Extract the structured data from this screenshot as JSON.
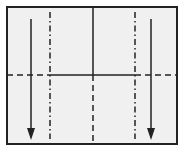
{
  "diagram": {
    "type": "origami-fold-diagram",
    "paper": {
      "fill": "#f0f0f0",
      "stroke": "#222222",
      "x": 7,
      "y": 7,
      "width": 170,
      "height": 137
    },
    "lines": [
      {
        "name": "center-crease-top",
        "kind": "solid",
        "x1": 93,
        "y1": 7,
        "x2": 93,
        "y2": 75
      },
      {
        "name": "center-valley-fold-bottom",
        "kind": "dashed",
        "x1": 93,
        "y1": 75,
        "x2": 93,
        "y2": 144
      },
      {
        "name": "horizontal-crease-middle",
        "kind": "solid",
        "x1": 50,
        "y1": 75,
        "x2": 135,
        "y2": 75
      },
      {
        "name": "horizontal-valley-fold-left",
        "kind": "dashed",
        "x1": 7,
        "y1": 75,
        "x2": 50,
        "y2": 75
      },
      {
        "name": "horizontal-valley-fold-right",
        "kind": "dashed",
        "x1": 135,
        "y1": 75,
        "x2": 177,
        "y2": 75
      },
      {
        "name": "left-mountain-fold",
        "kind": "dash-dot",
        "x1": 50,
        "y1": 12,
        "x2": 50,
        "y2": 139
      },
      {
        "name": "right-mountain-fold",
        "kind": "dash-dot",
        "x1": 135,
        "y1": 12,
        "x2": 135,
        "y2": 139
      }
    ],
    "arrows": [
      {
        "name": "left-fold-down-arrow",
        "x": 31,
        "y1": 19,
        "y2": 130
      },
      {
        "name": "right-fold-down-arrow",
        "x": 151,
        "y1": 19,
        "y2": 130
      }
    ],
    "colors": {
      "line": "#222222",
      "paper": "#f0f0f0",
      "background": "#ffffff"
    }
  }
}
